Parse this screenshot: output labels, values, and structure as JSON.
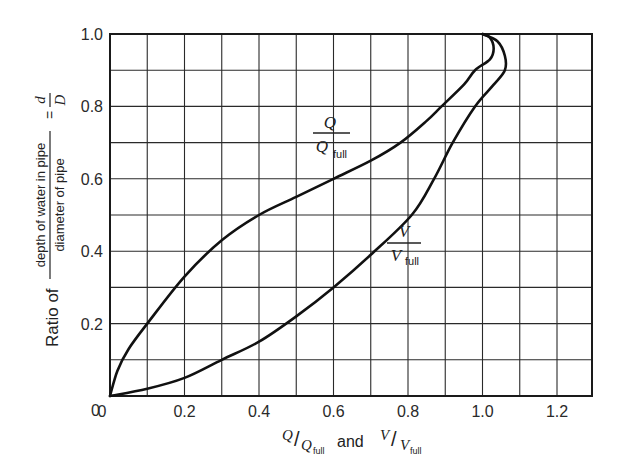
{
  "chart_data": {
    "type": "line",
    "title": "",
    "xlabel": "Q/Q_full and V/V_full",
    "ylabel": "Ratio of (depth of water in pipe / diameter of pipe) = d/D",
    "xlim": [
      0,
      1.3
    ],
    "ylim": [
      0,
      1.0
    ],
    "grid": true,
    "x_ticks": [
      "0",
      "0.2",
      "0.4",
      "0.6",
      "0.8",
      "1.0",
      "1.2"
    ],
    "y_ticks": [
      "0",
      "0.2",
      "0.4",
      "0.6",
      "0.8",
      "1.0"
    ],
    "series": [
      {
        "name": "Q/Q_full",
        "points": [
          [
            0,
            0
          ],
          [
            0.02,
            0.07
          ],
          [
            0.05,
            0.13
          ],
          [
            0.1,
            0.2
          ],
          [
            0.2,
            0.33
          ],
          [
            0.3,
            0.43
          ],
          [
            0.4,
            0.5
          ],
          [
            0.5,
            0.55
          ],
          [
            0.6,
            0.6
          ],
          [
            0.7,
            0.65
          ],
          [
            0.78,
            0.7
          ],
          [
            0.85,
            0.76
          ],
          [
            0.89,
            0.8
          ],
          [
            0.95,
            0.86
          ],
          [
            0.98,
            0.9
          ],
          [
            1.02,
            0.93
          ],
          [
            1.03,
            0.96
          ],
          [
            1.02,
            0.99
          ],
          [
            1.0,
            1.0
          ]
        ]
      },
      {
        "name": "V/V_full",
        "points": [
          [
            0,
            0
          ],
          [
            0.1,
            0.02
          ],
          [
            0.2,
            0.05
          ],
          [
            0.3,
            0.1
          ],
          [
            0.4,
            0.15
          ],
          [
            0.5,
            0.22
          ],
          [
            0.6,
            0.3
          ],
          [
            0.7,
            0.39
          ],
          [
            0.81,
            0.5
          ],
          [
            0.87,
            0.6
          ],
          [
            0.92,
            0.7
          ],
          [
            0.98,
            0.8
          ],
          [
            1.03,
            0.86
          ],
          [
            1.06,
            0.9
          ],
          [
            1.06,
            0.94
          ],
          [
            1.04,
            0.98
          ],
          [
            1.0,
            1.0
          ]
        ]
      }
    ],
    "annotations": [
      {
        "text": "Q / Q_full",
        "x": 0.6,
        "y": 0.7
      },
      {
        "text": "V / V_full",
        "x": 0.83,
        "y": 0.43
      }
    ]
  },
  "labels": {
    "y_ratio_of": "Ratio of",
    "y_num": "depth of water in pipe",
    "y_den": "diameter of pipe",
    "y_eq": "=",
    "y_d": "d",
    "y_D": "D",
    "x_Q": "Q",
    "x_Qfull_base": "Q",
    "x_full": "full",
    "x_and": "and",
    "x_V": "V",
    "x_Vfull_base": "V",
    "q_num": "Q",
    "q_den": "Q",
    "v_num": "V",
    "v_den": "V"
  }
}
